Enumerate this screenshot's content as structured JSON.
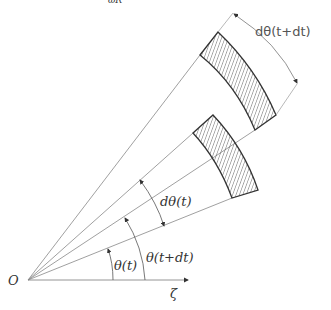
{
  "figure": {
    "top_fragment": "ωR",
    "origin_label": "O",
    "axis_label": "ζ",
    "labels": {
      "theta_t": "θ(t)",
      "theta_t_dt": "θ(t+dt)",
      "dtheta_t": "dθ(t)",
      "dtheta_t_dt": "dθ(t+dt)"
    },
    "colors": {
      "line": "#888888",
      "outline": "#333333",
      "hatch": "#555555",
      "background": "#ffffff"
    }
  }
}
